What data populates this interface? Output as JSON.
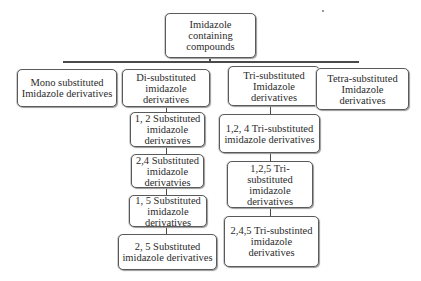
{
  "diagram": {
    "root": {
      "label": "Imidazole containing compounds"
    },
    "level1": [
      {
        "id": "mono",
        "label": "Mono substituted Imidazole derivatives"
      },
      {
        "id": "di",
        "label": "Di-substituted imidazole derivatives"
      },
      {
        "id": "tri",
        "label": "Tri-substituted Imidazole derivatives"
      },
      {
        "id": "tetra",
        "label": "Tetra-substituted Imidazole derivatives"
      }
    ],
    "di_children": [
      {
        "label": "1, 2 Substituted imidazole derivatives"
      },
      {
        "label": "2,4 Substituted imidazole derivatvies"
      },
      {
        "label": "1, 5 Substituted imidazole derivatives"
      },
      {
        "label": "2, 5 Substituted imidazole derivatives"
      }
    ],
    "tri_children": [
      {
        "label": "1,2, 4 Tri-substituted imidazole derivatives"
      },
      {
        "label": "1,2,5 Tri-substituted imidazole derivatives"
      },
      {
        "label": "2,4,5 Tri-substinted imidazole  derivatives"
      }
    ]
  },
  "colors": {
    "border": "#5a5a5a",
    "line": "#4a4a4a",
    "background": "#ffffff"
  }
}
